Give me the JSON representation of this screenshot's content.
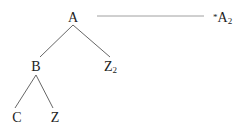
{
  "diagram": {
    "type": "syntax-tree",
    "nodes": [
      {
        "id": "A",
        "label": "A",
        "sub": ""
      },
      {
        "id": "B",
        "label": "B",
        "sub": ""
      },
      {
        "id": "Z2",
        "label": "Z",
        "sub": "2"
      },
      {
        "id": "C",
        "label": "C",
        "sub": ""
      },
      {
        "id": "Z",
        "label": "Z",
        "sub": ""
      }
    ],
    "edges": [
      [
        "A",
        "B"
      ],
      [
        "A",
        "Z2"
      ],
      [
        "B",
        "C"
      ],
      [
        "B",
        "Z"
      ]
    ],
    "annotation": {
      "prefix": "*",
      "label": "A",
      "sub": "2"
    },
    "colors": {
      "text": "#222222",
      "edge": "#555555",
      "line": "#888888"
    }
  }
}
